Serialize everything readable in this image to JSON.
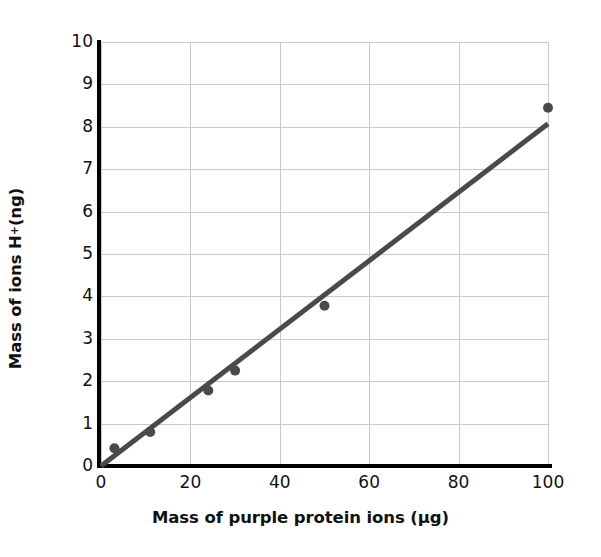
{
  "chart_data": {
    "type": "scatter",
    "title": "",
    "xlabel": "Mass of purple protein ions (μg)",
    "ylabel_parts": {
      "prefix": "Mass of ions H",
      "superscript": "+",
      "suffix": " (ng)"
    },
    "ylabel": "Mass of ions H+ (ng)",
    "xlim": [
      0,
      100
    ],
    "ylim": [
      0,
      10
    ],
    "xticks": [
      0,
      20,
      40,
      60,
      80,
      100
    ],
    "yticks": [
      0,
      1,
      2,
      3,
      4,
      5,
      6,
      7,
      8,
      9,
      10
    ],
    "xtick_labels": [
      "0",
      "20",
      "40",
      "60",
      "80",
      "100"
    ],
    "ytick_labels": [
      "0",
      "1",
      "2",
      "3",
      "4",
      "5",
      "6",
      "7",
      "8",
      "9",
      "10"
    ],
    "grid": true,
    "legend": null,
    "series": [
      {
        "name": "measurements",
        "type": "scatter",
        "marker": "circle",
        "color": "#4a4a4a",
        "points": [
          {
            "x": 3,
            "y": 0.42
          },
          {
            "x": 11,
            "y": 0.8
          },
          {
            "x": 24,
            "y": 1.78
          },
          {
            "x": 30,
            "y": 2.25
          },
          {
            "x": 50,
            "y": 3.78
          },
          {
            "x": 100,
            "y": 8.45
          }
        ]
      },
      {
        "name": "best-fit-line",
        "type": "line",
        "color": "#4a4a4a",
        "points": [
          {
            "x": 0,
            "y": 0
          },
          {
            "x": 100,
            "y": 8.07
          }
        ]
      }
    ],
    "colors": {
      "data": "#4a4a4a",
      "axis": "#000000",
      "grid": "#c9c9c9",
      "background": "#ffffff",
      "text": "#111111"
    }
  }
}
